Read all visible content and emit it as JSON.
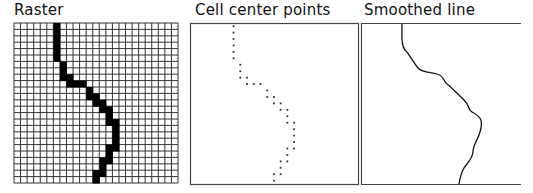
{
  "panels": [
    {
      "id": "raster",
      "title": "Raster"
    },
    {
      "id": "points",
      "title": "Cell center points"
    },
    {
      "id": "smooth",
      "title": "Smoothed line"
    }
  ],
  "raster": {
    "cols": 25,
    "rows": 25,
    "origin": [
      14,
      23
    ],
    "size": [
      164,
      160
    ],
    "grid_color": "#333333",
    "fill_color": "#000000",
    "cells": [
      [
        6,
        0
      ],
      [
        6,
        1
      ],
      [
        6,
        2
      ],
      [
        6,
        3
      ],
      [
        6,
        4
      ],
      [
        6,
        5
      ],
      [
        7,
        6
      ],
      [
        7,
        7
      ],
      [
        7,
        8
      ],
      [
        8,
        8
      ],
      [
        8,
        9
      ],
      [
        9,
        9
      ],
      [
        10,
        9
      ],
      [
        11,
        10
      ],
      [
        11,
        11
      ],
      [
        12,
        11
      ],
      [
        12,
        12
      ],
      [
        13,
        12
      ],
      [
        13,
        13
      ],
      [
        14,
        13
      ],
      [
        14,
        14
      ],
      [
        14,
        15
      ],
      [
        15,
        15
      ],
      [
        15,
        16
      ],
      [
        15,
        17
      ],
      [
        15,
        18
      ],
      [
        15,
        19
      ],
      [
        14,
        19
      ],
      [
        14,
        20
      ],
      [
        14,
        21
      ],
      [
        13,
        21
      ],
      [
        13,
        22
      ],
      [
        13,
        23
      ],
      [
        12,
        23
      ],
      [
        12,
        24
      ]
    ]
  },
  "points_box": {
    "x": 190,
    "y": 23,
    "w": 168,
    "h": 161,
    "stroke": "#444444",
    "dot_color": "#333333"
  },
  "smooth_box": {
    "x": 361,
    "y": 23,
    "w": 160,
    "h": 161,
    "stroke": "#444444",
    "line_color": "#111111"
  }
}
